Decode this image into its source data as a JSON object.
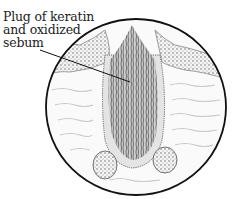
{
  "figure": {
    "labels": [
      {
        "id": "plug",
        "lines": [
          "Plug of keratin",
          "and oxidized",
          "sebum"
        ]
      }
    ]
  }
}
